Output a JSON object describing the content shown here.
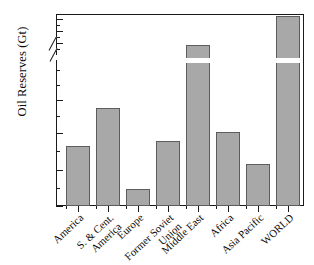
{
  "chart_data": {
    "type": "bar",
    "title": "",
    "xlabel": "",
    "ylabel": "Oil Reserves (Gt)",
    "categories": [
      "America",
      "S. & Cent. America",
      "Europe",
      "Former Soviet Union",
      "Middle East",
      "Africa",
      "Asia Pacific",
      "WORLD"
    ],
    "category_lines": [
      [
        "America"
      ],
      [
        "S. & Cent.",
        "America"
      ],
      [
        "Europe"
      ],
      [
        "Former Soviet",
        "Union"
      ],
      [
        "Middle East"
      ],
      [
        "Africa"
      ],
      [
        "Asia Pacific"
      ],
      [
        "WORLD"
      ]
    ],
    "values": [
      8.4,
      13.8,
      2.4,
      9.1,
      97,
      10.2,
      5.9,
      142
    ],
    "units": "Gt",
    "axis_break": {
      "present": true,
      "lower_range": [
        0,
        17
      ],
      "upper_range": [
        78,
        147
      ]
    },
    "ylim_lower": [
      0,
      17
    ],
    "ylim_upper": [
      78,
      147
    ],
    "yticks_lower": [
      0,
      5,
      10,
      15
    ],
    "yticks_upper": [
      80,
      100,
      120,
      140
    ],
    "ytick_labels_lower": [
      "0",
      "5",
      "10",
      "15"
    ],
    "ytick_labels_upper": [
      "80",
      "100",
      "120",
      "140"
    ],
    "grid": false,
    "legend": null,
    "bar_color": "#a8a8a8",
    "bar_edge_color": "#5d5d5d",
    "axis_color": "#1a1a1a"
  },
  "axis": {
    "y_title": "Oil Reserves (Gt)",
    "ticks": {
      "upper": [
        {
          "label": "140",
          "y": 19
        },
        {
          "label": "120",
          "y": 31
        },
        {
          "label": "100",
          "y": 43
        },
        {
          "label": "80",
          "y": 55
        }
      ],
      "lower": [
        {
          "label": "15",
          "y": 100
        },
        {
          "label": "10",
          "y": 133
        },
        {
          "label": "5",
          "y": 170
        },
        {
          "label": "0",
          "y": 206
        }
      ]
    }
  },
  "bars": [
    {
      "name": "America",
      "value": 8.4,
      "label_lines": [
        "America"
      ],
      "x": 66,
      "w": 24,
      "top": 146,
      "broken": false
    },
    {
      "name": "S. & Cent. America",
      "value": 13.8,
      "label_lines": [
        "S. & Cent.",
        "America"
      ],
      "x": 96,
      "w": 24,
      "top": 108,
      "broken": false
    },
    {
      "name": "Europe",
      "value": 2.4,
      "label_lines": [
        "Europe"
      ],
      "x": 126,
      "w": 24,
      "top": 189,
      "broken": false
    },
    {
      "name": "Former Soviet Union",
      "value": 9.1,
      "label_lines": [
        "Former Soviet",
        "Union"
      ],
      "x": 156,
      "w": 24,
      "top": 141,
      "broken": false
    },
    {
      "name": "Middle East",
      "value": 97,
      "label_lines": [
        "Middle East"
      ],
      "x": 186,
      "w": 24,
      "top": 45,
      "broken": true
    },
    {
      "name": "Africa",
      "value": 10.2,
      "label_lines": [
        "Africa"
      ],
      "x": 216,
      "w": 24,
      "top": 132,
      "broken": false
    },
    {
      "name": "Asia Pacific",
      "value": 5.9,
      "label_lines": [
        "Asia Pacific"
      ],
      "x": 246,
      "w": 24,
      "top": 164,
      "broken": false
    },
    {
      "name": "WORLD",
      "value": 142,
      "label_lines": [
        "WORLD"
      ],
      "x": 276,
      "w": 24,
      "top": 16,
      "broken": true
    }
  ]
}
